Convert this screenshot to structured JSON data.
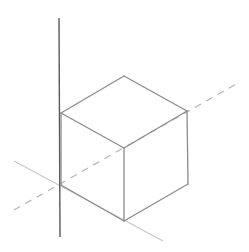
{
  "diagram": {
    "type": "isometric-cube-on-axes",
    "background": "#ffffff",
    "colors": {
      "vertical_axis": "#5a5a5a",
      "cube_edge": "#8c8c8c",
      "horizontal_axis": "#c8c8c8",
      "dashed_axis": "#b4b4b4"
    },
    "axes": {
      "vertical": {
        "x1": 59,
        "y1": 18,
        "x2": 60,
        "y2": 237
      },
      "solid_diagonal": {
        "x1": 14,
        "y1": 161,
        "x2": 163,
        "y2": 241
      },
      "dashed_diagonal": {
        "x1": 14,
        "y1": 210,
        "x2": 238,
        "y2": 83
      }
    },
    "cube": {
      "vertices": {
        "top": [
          124,
          76
        ],
        "upper_left": [
          61,
          113
        ],
        "upper_right": [
          187,
          111
        ],
        "center": [
          124,
          148
        ],
        "lower_left": [
          61,
          185
        ],
        "lower_right": [
          188,
          184
        ],
        "bottom": [
          124,
          221
        ]
      },
      "edges": [
        [
          "top",
          "upper_left"
        ],
        [
          "top",
          "upper_right"
        ],
        [
          "upper_left",
          "center"
        ],
        [
          "upper_right",
          "center"
        ],
        [
          "upper_left",
          "lower_left"
        ],
        [
          "center",
          "bottom"
        ],
        [
          "upper_right",
          "lower_right"
        ],
        [
          "lower_left",
          "bottom"
        ],
        [
          "lower_right",
          "bottom"
        ]
      ]
    }
  }
}
